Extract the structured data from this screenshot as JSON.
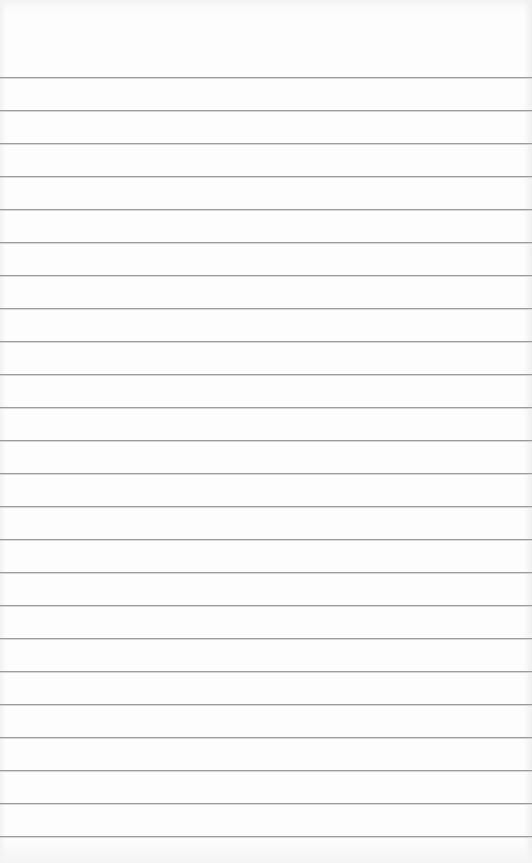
{
  "page": {
    "type": "lined-paper",
    "background_color": "#fdfdfd",
    "rule_color": "#9c9c9c",
    "rule_count": 24,
    "first_rule_y": 77,
    "rule_spacing": 33
  }
}
